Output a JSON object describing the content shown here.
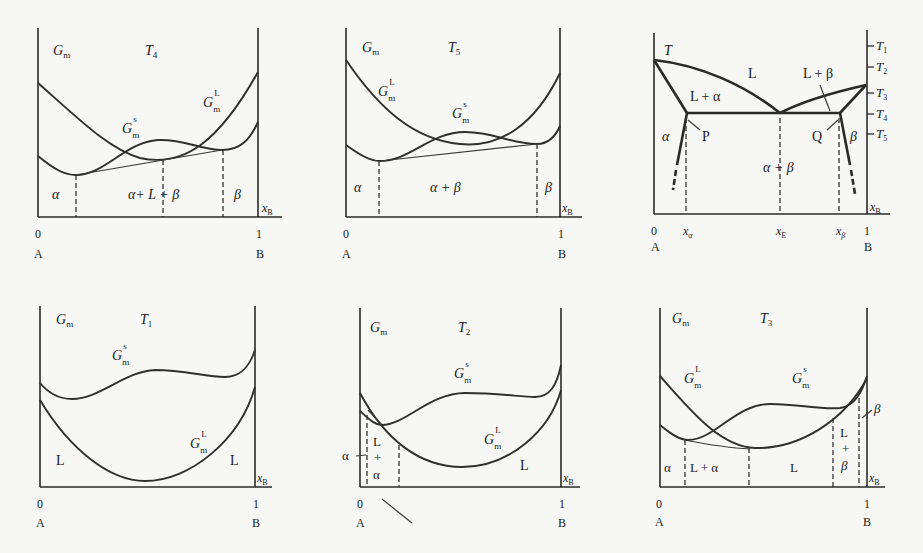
{
  "figure": {
    "panels": [
      {
        "id": "gibbs-T4",
        "y_label": "G",
        "y_label_sub": "m",
        "temperature": "T",
        "temperature_sub": "4",
        "curves": [
          {
            "name": "liquid",
            "label": "G",
            "sub": "m",
            "sup": "L"
          },
          {
            "name": "solid",
            "label": "G",
            "sub": "m",
            "sup": "s"
          }
        ],
        "regions": [
          "α",
          "α+ L + β",
          "β"
        ],
        "x_label": "x",
        "x_label_sub": "B",
        "ticks": [
          "0",
          "1"
        ],
        "ends": [
          "A",
          "B"
        ]
      },
      {
        "id": "gibbs-T5",
        "y_label": "G",
        "y_label_sub": "m",
        "temperature": "T",
        "temperature_sub": "5",
        "curves": [
          {
            "name": "liquid",
            "label": "G",
            "sub": "m",
            "sup": "L"
          },
          {
            "name": "solid",
            "label": "G",
            "sub": "m",
            "sup": "s"
          }
        ],
        "regions": [
          "α",
          "α + β",
          "β"
        ],
        "x_label": "x",
        "x_label_sub": "B",
        "ticks": [
          "0",
          "1"
        ],
        "ends": [
          "A",
          "B"
        ]
      },
      {
        "id": "phase-diagram",
        "y_label": "T",
        "regions": [
          "L",
          "L + α",
          "L + β",
          "α",
          "β",
          "α + β"
        ],
        "points": [
          "P",
          "Q"
        ],
        "temps": [
          {
            "label": "T",
            "sub": "1"
          },
          {
            "label": "T",
            "sub": "2"
          },
          {
            "label": "T",
            "sub": "3"
          },
          {
            "label": "T",
            "sub": "4"
          },
          {
            "label": "T",
            "sub": "5"
          }
        ],
        "x_ticks": [
          {
            "label": "0"
          },
          {
            "label": "x",
            "sub": "α"
          },
          {
            "label": "x",
            "sub": "E"
          },
          {
            "label": "x",
            "sub": "β"
          },
          {
            "label": "1"
          }
        ],
        "x_label": "x",
        "x_label_sub": "B",
        "ends": [
          "A",
          "B"
        ]
      },
      {
        "id": "gibbs-T1",
        "y_label": "G",
        "y_label_sub": "m",
        "temperature": "T",
        "temperature_sub": "1",
        "curves": [
          {
            "name": "solid",
            "label": "G",
            "sub": "m",
            "sup": "s"
          },
          {
            "name": "liquid",
            "label": "G",
            "sub": "m",
            "sup": "L"
          }
        ],
        "regions": [
          "L",
          "L"
        ],
        "x_label": "x",
        "x_label_sub": "B",
        "ticks": [
          "0",
          "1"
        ],
        "ends": [
          "A",
          "B"
        ]
      },
      {
        "id": "gibbs-T2",
        "y_label": "G",
        "y_label_sub": "m",
        "temperature": "T",
        "temperature_sub": "2",
        "curves": [
          {
            "name": "solid",
            "label": "G",
            "sub": "m",
            "sup": "s"
          },
          {
            "name": "liquid",
            "label": "G",
            "sub": "m",
            "sup": "L"
          }
        ],
        "regions": [
          "α",
          "L",
          "+",
          "α",
          "L"
        ],
        "x_label": "x",
        "x_label_sub": "B",
        "ticks": [
          "0",
          "1"
        ],
        "ends": [
          "A",
          "B"
        ]
      },
      {
        "id": "gibbs-T3",
        "y_label": "G",
        "y_label_sub": "m",
        "temperature": "T",
        "temperature_sub": "3",
        "curves": [
          {
            "name": "liquid",
            "label": "G",
            "sub": "m",
            "sup": "L"
          },
          {
            "name": "solid",
            "label": "G",
            "sub": "m",
            "sup": "s"
          }
        ],
        "regions": [
          "α",
          "L + α",
          "L",
          "L",
          "+",
          "β",
          "β"
        ],
        "x_label": "x",
        "x_label_sub": "B",
        "ticks": [
          "0",
          "1"
        ],
        "ends": [
          "A",
          "B"
        ]
      }
    ]
  },
  "colors": {
    "background": "#f7f7f5",
    "ink": "#2a2a2a"
  }
}
